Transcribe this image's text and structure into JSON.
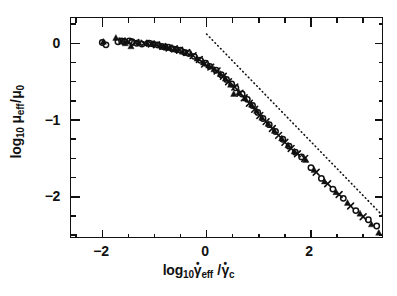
{
  "figure": {
    "background_color": "#ffffff",
    "foreground_color": "#111111"
  },
  "axes": {
    "x": {
      "title_prefix": "log",
      "title_prefix_sub": "10",
      "title_symbol_1": "γ",
      "title_symbol_1_sub": "eff",
      "title_separator": "/",
      "title_symbol_2": "γ",
      "title_symbol_2_sub": "c",
      "title_plain": "log10 γ̇eff / γ̇c",
      "major_ticks": [
        -2,
        0,
        2
      ],
      "major_tick_labels": [
        "−2",
        "0",
        "2"
      ],
      "minor_tick_step": 0.5,
      "range": [
        -2.6,
        3.4
      ]
    },
    "y": {
      "title_prefix": "log",
      "title_prefix_sub": "10",
      "title_symbol_1": "μ",
      "title_symbol_1_sub": "eff",
      "title_separator": "/",
      "title_symbol_2": "μ",
      "title_symbol_2_sub": "0",
      "title_plain": "log10 μeff / μ0",
      "major_ticks": [
        0,
        -1,
        -2
      ],
      "major_tick_labels": [
        "0",
        "−1",
        "−2"
      ],
      "minor_tick_step": 0.25,
      "range": [
        -2.55,
        0.33
      ]
    }
  },
  "chart_data": {
    "type": "scatter",
    "title": "",
    "xlabel": "log10 γ̇eff / γ̇c",
    "ylabel": "log10 μeff / μ0",
    "xlim": [
      -2.6,
      3.4
    ],
    "ylim": [
      -2.55,
      0.33
    ],
    "xticks": [
      -2,
      0,
      2
    ],
    "yticks": [
      0,
      -1,
      -2
    ],
    "grid": false,
    "legend": null,
    "frame": "box",
    "tick_direction": "in",
    "series": [
      {
        "name": "open-circle",
        "marker": "circle-open",
        "points": [
          [
            -2.0,
            0.01
          ],
          [
            -1.93,
            -0.02
          ],
          [
            -1.7,
            0.02
          ],
          [
            -1.63,
            0.03
          ],
          [
            -1.58,
            0.02
          ],
          [
            -1.48,
            0.03
          ],
          [
            -1.43,
            0.02
          ],
          [
            -1.34,
            0.0
          ],
          [
            -1.24,
            -0.01
          ],
          [
            -1.1,
            0.0
          ],
          [
            -1.02,
            -0.01
          ],
          [
            -0.94,
            -0.02
          ],
          [
            -0.86,
            -0.04
          ],
          [
            -0.8,
            -0.05
          ],
          [
            -0.74,
            -0.05
          ],
          [
            -0.66,
            -0.07
          ],
          [
            -0.58,
            -0.08
          ],
          [
            -0.5,
            -0.09
          ],
          [
            -0.42,
            -0.12
          ],
          [
            -0.35,
            -0.13
          ],
          [
            -0.24,
            -0.17
          ],
          [
            -0.12,
            -0.22
          ],
          [
            -0.02,
            -0.26
          ],
          [
            0.06,
            -0.3
          ],
          [
            0.18,
            -0.35
          ],
          [
            0.28,
            -0.41
          ],
          [
            0.38,
            -0.47
          ],
          [
            0.48,
            -0.53
          ],
          [
            0.56,
            -0.58
          ],
          [
            0.68,
            -0.66
          ],
          [
            0.78,
            -0.73
          ],
          [
            0.88,
            -0.81
          ],
          [
            0.98,
            -0.9
          ],
          [
            1.08,
            -0.98
          ],
          [
            1.2,
            -1.06
          ],
          [
            1.32,
            -1.15
          ],
          [
            1.46,
            -1.25
          ],
          [
            1.58,
            -1.34
          ],
          [
            1.7,
            -1.42
          ],
          [
            1.82,
            -1.48
          ],
          [
            2.0,
            -1.62
          ],
          [
            2.2,
            -1.76
          ],
          [
            2.42,
            -1.9
          ],
          [
            2.62,
            -2.02
          ],
          [
            2.86,
            -2.18
          ],
          [
            3.1,
            -2.3
          ],
          [
            3.26,
            -2.38
          ]
        ]
      },
      {
        "name": "filled-triangle",
        "marker": "triangle-filled",
        "points": [
          [
            -1.98,
            0.02
          ],
          [
            -1.74,
            0.07
          ],
          [
            -1.56,
            0.0
          ],
          [
            -1.45,
            -0.04
          ],
          [
            -1.3,
            0.01
          ],
          [
            -1.14,
            0.0
          ],
          [
            -1.04,
            -0.01
          ],
          [
            -0.9,
            -0.03
          ],
          [
            -0.78,
            -0.05
          ],
          [
            -0.7,
            -0.06
          ],
          [
            -0.6,
            -0.08
          ],
          [
            -0.46,
            -0.11
          ],
          [
            -0.3,
            -0.14
          ],
          [
            -0.18,
            -0.2
          ],
          [
            -0.06,
            -0.25
          ],
          [
            0.04,
            -0.29
          ],
          [
            0.14,
            -0.34
          ],
          [
            0.26,
            -0.4
          ],
          [
            0.36,
            -0.46
          ],
          [
            0.46,
            -0.54
          ],
          [
            0.52,
            -0.66
          ],
          [
            0.62,
            -0.64
          ],
          [
            0.74,
            -0.72
          ],
          [
            0.86,
            -0.8
          ],
          [
            0.96,
            -0.88
          ],
          [
            1.06,
            -0.97
          ],
          [
            1.18,
            -1.05
          ],
          [
            1.3,
            -1.14
          ],
          [
            1.44,
            -1.24
          ],
          [
            1.56,
            -1.33
          ],
          [
            1.68,
            -1.41
          ],
          [
            1.9,
            -1.52
          ],
          [
            2.06,
            -1.65
          ],
          [
            2.26,
            -1.8
          ],
          [
            2.48,
            -1.94
          ],
          [
            2.7,
            -2.08
          ],
          [
            2.94,
            -2.22
          ],
          [
            3.16,
            -2.36
          ],
          [
            3.3,
            -2.47
          ]
        ]
      },
      {
        "name": "cross",
        "marker": "x-cross",
        "points": [
          [
            -1.62,
            0.03
          ],
          [
            -1.5,
            0.02
          ],
          [
            -1.36,
            0.01
          ],
          [
            -1.2,
            0.0
          ],
          [
            -1.06,
            -0.01
          ],
          [
            -0.96,
            -0.02
          ],
          [
            -0.84,
            -0.04
          ],
          [
            -0.72,
            -0.06
          ],
          [
            -0.62,
            -0.07
          ],
          [
            -0.52,
            -0.09
          ],
          [
            -0.38,
            -0.12
          ],
          [
            -0.26,
            -0.16
          ],
          [
            -0.14,
            -0.21
          ],
          [
            -0.04,
            -0.27
          ],
          [
            0.08,
            -0.31
          ],
          [
            0.2,
            -0.36
          ],
          [
            0.32,
            -0.43
          ],
          [
            0.42,
            -0.5
          ],
          [
            0.54,
            -0.57
          ],
          [
            0.64,
            -0.65
          ],
          [
            0.72,
            -0.71
          ],
          [
            0.82,
            -0.78
          ],
          [
            0.92,
            -0.86
          ],
          [
            1.02,
            -0.94
          ],
          [
            1.14,
            -1.02
          ],
          [
            1.26,
            -1.11
          ],
          [
            1.38,
            -1.2
          ],
          [
            1.5,
            -1.29
          ],
          [
            1.62,
            -1.37
          ],
          [
            1.74,
            -1.44
          ],
          [
            1.88,
            -1.5
          ],
          [
            2.1,
            -1.68
          ],
          [
            2.32,
            -1.83
          ],
          [
            2.54,
            -1.97
          ],
          [
            2.76,
            -2.12
          ],
          [
            3.0,
            -2.26
          ]
        ]
      }
    ],
    "reference_line": {
      "style": "dotted",
      "start": [
        0.0,
        0.12
      ],
      "end": [
        3.38,
        -2.25
      ],
      "slope": -0.7
    }
  }
}
